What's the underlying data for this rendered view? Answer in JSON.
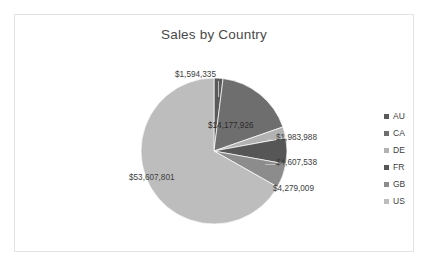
{
  "chart": {
    "title": "Sales by Country"
  },
  "legend": {
    "position": "right",
    "items": [
      {
        "label": "AU",
        "color": "#5a5a5a"
      },
      {
        "label": "CA",
        "color": "#6e6e6e"
      },
      {
        "label": "DE",
        "color": "#b2b2b2"
      },
      {
        "label": "FR",
        "color": "#565656"
      },
      {
        "label": "GB",
        "color": "#8c8c8c"
      },
      {
        "label": "US",
        "color": "#bdbdbd"
      }
    ]
  },
  "labels": {
    "au": "$1,594,335",
    "ca": "$14,177,926",
    "de": "$1,983,988",
    "fr": "$4,607,538",
    "gb": "$4,279,009",
    "us": "$53,607,801"
  },
  "chart_data": {
    "type": "pie",
    "title": "Sales by Country",
    "xlabel": "",
    "ylabel": "",
    "categories": [
      "AU",
      "CA",
      "DE",
      "FR",
      "GB",
      "US"
    ],
    "values": [
      1594335,
      14177926,
      1983988,
      4607538,
      4279009,
      53607801
    ],
    "value_labels": [
      "$1,594,335",
      "$14,177,926",
      "$1,983,988",
      "$4,607,538",
      "$4,279,009",
      "$53,607,801"
    ],
    "colors": [
      "#5a5a5a",
      "#6e6e6e",
      "#b2b2b2",
      "#565656",
      "#8c8c8c",
      "#bdbdbd"
    ],
    "total": 80250597,
    "start_angle": 0,
    "direction": "clockwise",
    "legend_position": "right",
    "grid": false,
    "data_labels": true
  }
}
